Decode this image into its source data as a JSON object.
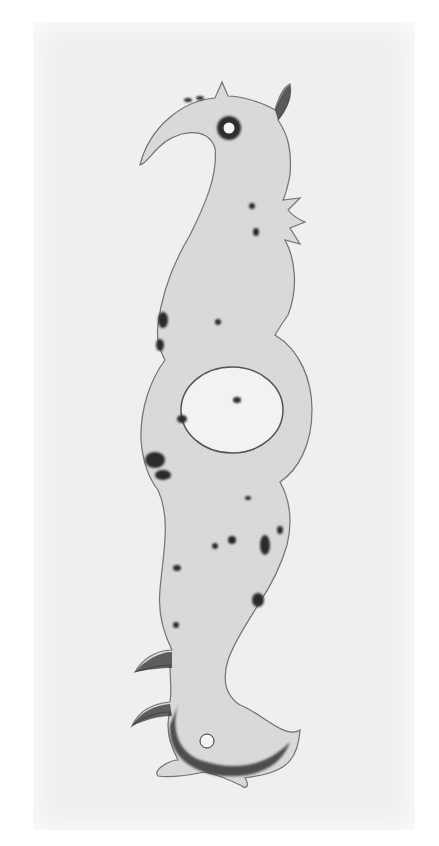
{
  "image": {
    "subject": "ornate metal plate photograph",
    "description": "Black-and-white photograph of a pierced metal escutcheon/hinge plate shaped as a stylized S-curved creature with hooked heads at top and bottom, nail holes, and a central oval keyhole-like ring",
    "colors": {
      "page": "#ffffff",
      "backdrop": "#efefef",
      "metal": "#d9d9d9",
      "metal_light": "#e6e6e6",
      "corrosion": "#2a2a2a",
      "hole": "#f4f4f4"
    }
  }
}
